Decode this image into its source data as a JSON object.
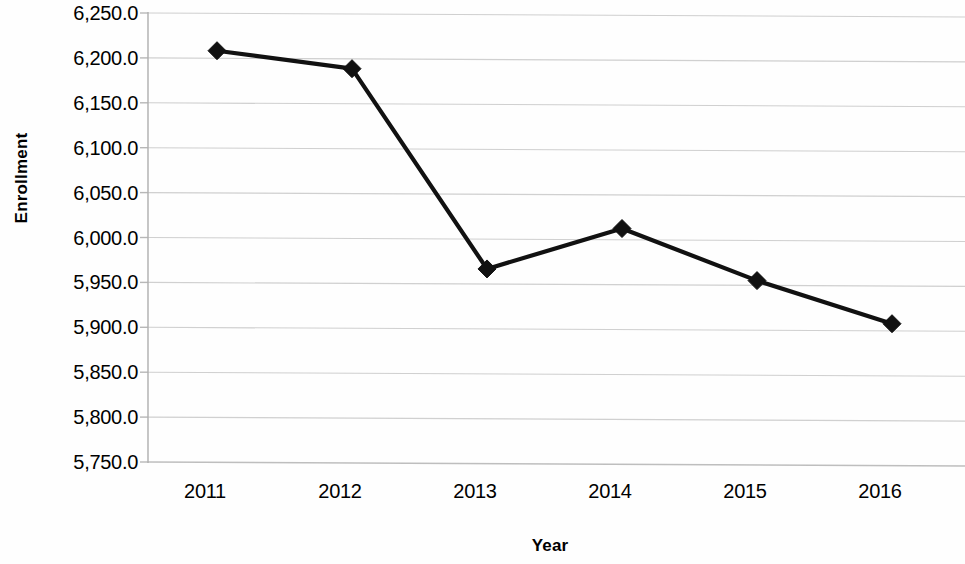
{
  "chart_data": {
    "type": "line",
    "title": "",
    "xlabel": "Year",
    "ylabel": "Enrollment",
    "categories": [
      "2011",
      "2012",
      "2013",
      "2014",
      "2015",
      "2016"
    ],
    "values": [
      6208,
      6188,
      5965,
      6010,
      5952,
      5904
    ],
    "series": [
      {
        "name": "Enrollment",
        "values": [
          6208,
          6188,
          5965,
          6010,
          5952,
          5904
        ]
      }
    ],
    "x_tick_labels": [
      "2011",
      "2012",
      "2013",
      "2014",
      "2015",
      "2016"
    ],
    "y_tick_labels": [
      "6,250.0",
      "6,200.0",
      "6,150.0",
      "6,100.0",
      "6,050.0",
      "6,000.0",
      "5,950.0",
      "5,900.0",
      "5,850.0",
      "5,800.0",
      "5,750.0"
    ],
    "y_tick_values": [
      6250,
      6200,
      6150,
      6100,
      6050,
      6000,
      5950,
      5900,
      5850,
      5800,
      5750
    ],
    "ylim": [
      5750,
      6250
    ],
    "y_tick_step": 50,
    "grid": true,
    "grid_axis": "y",
    "legend": false,
    "legend_position": "none",
    "marker": "diamond",
    "line_color": "#111111",
    "marker_color": "#111111",
    "grid_color": "#b4b4b4",
    "axis_color": "#b0b0b0",
    "background_color": "#ffffff"
  },
  "axes": {
    "y_title": "Enrollment",
    "x_title": "Year"
  }
}
